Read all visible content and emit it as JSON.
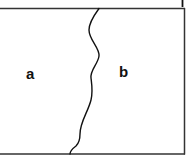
{
  "diagram": {
    "type": "two-region panel separated by wavy boundary",
    "regions": [
      {
        "id": "a",
        "label": "a"
      },
      {
        "id": "b",
        "label": "b"
      }
    ],
    "colors": {
      "line": "#111111",
      "frame": "#333333",
      "background": "#ffffff"
    }
  }
}
